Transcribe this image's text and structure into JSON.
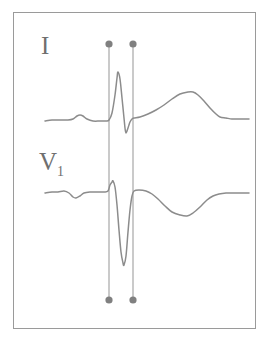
{
  "figure": {
    "type": "ecg-strip",
    "background_color": "#ffffff",
    "frame": {
      "border_color": "#9a9a9a",
      "x": 13,
      "y": 12,
      "width": 243,
      "height": 317
    }
  },
  "labels": {
    "lead_i": "I",
    "lead_v1_base": "V",
    "lead_v1_sub": "1"
  },
  "colors": {
    "trace": "#8c8c8c",
    "caliper_line": "#9e9e9e",
    "caliper_dot": "#808080",
    "label": "#6f6f6f",
    "frame": "#9a9a9a"
  },
  "calipers": {
    "count": 2,
    "line_1_x": 109,
    "line_2_x": 133,
    "top_y": 44,
    "bottom_y": 300,
    "dot_radius": 3.6,
    "line_width": 1.1,
    "dot_top_1": {
      "x": 109,
      "y": 44
    },
    "dot_top_2": {
      "x": 133,
      "y": 44
    },
    "dot_bottom_1": {
      "x": 109,
      "y": 300
    },
    "dot_bottom_2": {
      "x": 133,
      "y": 300
    }
  },
  "chart_data": {
    "type": "line",
    "title": "",
    "xlabel": "",
    "ylabel": "",
    "grid": false,
    "legend": "none",
    "series": [
      {
        "name": "I",
        "baseline_y": 120,
        "features": {
          "p_wave": {
            "peak_x": 80,
            "peak_y": 115,
            "polarity": "positive",
            "amplitude": "small"
          },
          "qrs_onset_x": 109,
          "r_peak": {
            "x": 118,
            "y": 72,
            "polarity": "positive",
            "amplitude": "tall"
          },
          "s_trough": {
            "x": 126,
            "y": 133,
            "polarity": "negative",
            "amplitude": "small"
          },
          "qrs_offset_x": 133,
          "t_wave": {
            "peak_x": 191,
            "peak_y": 92,
            "polarity": "positive",
            "amplitude": "broad-positive"
          }
        },
        "points": [
          [
            45,
            121
          ],
          [
            52,
            120
          ],
          [
            60,
            120
          ],
          [
            68,
            120
          ],
          [
            73,
            119
          ],
          [
            77,
            116
          ],
          [
            80,
            115
          ],
          [
            83,
            116
          ],
          [
            87,
            119
          ],
          [
            93,
            121
          ],
          [
            100,
            121
          ],
          [
            106,
            121
          ],
          [
            109,
            120
          ],
          [
            112,
            113
          ],
          [
            115,
            95
          ],
          [
            117,
            78
          ],
          [
            118,
            72
          ],
          [
            120,
            79
          ],
          [
            122,
            98
          ],
          [
            124,
            118
          ],
          [
            125,
            128
          ],
          [
            126,
            133
          ],
          [
            128,
            128
          ],
          [
            130,
            122
          ],
          [
            132,
            119
          ],
          [
            134,
            118
          ],
          [
            140,
            117
          ],
          [
            148,
            114
          ],
          [
            156,
            110
          ],
          [
            164,
            105
          ],
          [
            172,
            99
          ],
          [
            180,
            94
          ],
          [
            188,
            92
          ],
          [
            193,
            92
          ],
          [
            198,
            95
          ],
          [
            204,
            101
          ],
          [
            210,
            108
          ],
          [
            216,
            114
          ],
          [
            220,
            117
          ],
          [
            226,
            118
          ],
          [
            232,
            119
          ],
          [
            238,
            119
          ],
          [
            244,
            119
          ],
          [
            249,
            119
          ]
        ]
      },
      {
        "name": "V1",
        "baseline_y": 193,
        "features": {
          "p_wave": {
            "peak_x": 76,
            "peak_y": 197,
            "polarity": "biphasic",
            "amplitude": "small"
          },
          "qrs_onset_x": 109,
          "r_peak": {
            "x": 113,
            "y": 181,
            "polarity": "positive",
            "amplitude": "small-r"
          },
          "s_trough": {
            "x": 123,
            "y": 265,
            "polarity": "negative",
            "amplitude": "deep"
          },
          "qrs_offset_x": 133,
          "t_wave": {
            "trough_x": 187,
            "trough_y": 215,
            "polarity": "negative",
            "amplitude": "inverted"
          }
        },
        "points": [
          [
            45,
            193
          ],
          [
            52,
            192
          ],
          [
            58,
            192
          ],
          [
            64,
            191
          ],
          [
            69,
            193
          ],
          [
            73,
            197
          ],
          [
            76,
            198
          ],
          [
            80,
            196
          ],
          [
            84,
            193
          ],
          [
            90,
            192
          ],
          [
            97,
            192
          ],
          [
            104,
            192
          ],
          [
            108,
            191
          ],
          [
            110,
            185
          ],
          [
            112,
            182
          ],
          [
            113,
            181
          ],
          [
            115,
            187
          ],
          [
            117,
            205
          ],
          [
            119,
            230
          ],
          [
            121,
            252
          ],
          [
            123,
            263
          ],
          [
            124,
            265
          ],
          [
            126,
            256
          ],
          [
            128,
            232
          ],
          [
            130,
            210
          ],
          [
            132,
            196
          ],
          [
            134,
            191
          ],
          [
            139,
            190
          ],
          [
            146,
            191
          ],
          [
            152,
            194
          ],
          [
            158,
            199
          ],
          [
            165,
            206
          ],
          [
            172,
            212
          ],
          [
            180,
            215
          ],
          [
            187,
            216
          ],
          [
            193,
            213
          ],
          [
            200,
            207
          ],
          [
            207,
            200
          ],
          [
            213,
            196
          ],
          [
            219,
            194
          ],
          [
            226,
            193
          ],
          [
            233,
            193
          ],
          [
            240,
            193
          ],
          [
            246,
            193
          ],
          [
            249,
            193
          ]
        ]
      }
    ]
  }
}
